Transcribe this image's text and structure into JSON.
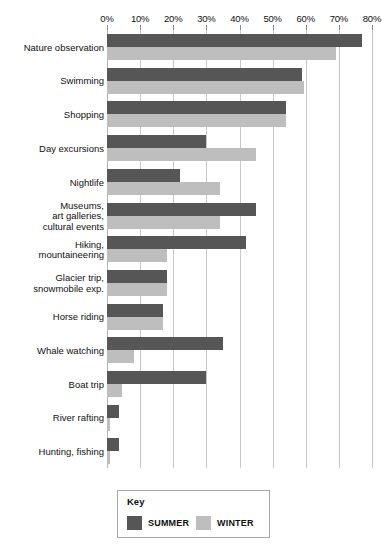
{
  "chart_data": {
    "type": "bar",
    "orientation": "horizontal",
    "title": "",
    "xlabel": "",
    "ylabel": "",
    "xlim": [
      0,
      80
    ],
    "grid": true,
    "legend_position": "bottom",
    "tick_labels": [
      "0%",
      "10%",
      "20%",
      "30%",
      "40%",
      "50%",
      "60%",
      "70%",
      "80%"
    ],
    "tick_values": [
      0,
      10,
      20,
      30,
      40,
      50,
      60,
      70,
      80
    ],
    "categories": [
      "Nature observation",
      "Swimming",
      "Shopping",
      "Day excursions",
      "Nightlife",
      "Museums,\nart galleries,\ncultural events",
      "Hiking,\nmountaineering",
      "Glacier trip,\nsnowmobile exp.",
      "Horse riding",
      "Whale watching",
      "Boat trip",
      "River rafting",
      "Hunting, fishing"
    ],
    "series": [
      {
        "name": "SUMMER",
        "color": "#565656",
        "values": [
          77,
          59,
          54,
          30,
          22,
          45,
          42,
          18,
          17,
          35,
          30,
          3.5,
          3.5
        ]
      },
      {
        "name": "WINTER",
        "color": "#bebebe",
        "values": [
          69,
          59.5,
          54,
          45,
          34,
          34,
          18,
          18,
          17,
          8,
          4.5,
          1,
          1
        ]
      }
    ]
  },
  "legend": {
    "title": "Key",
    "entries": [
      {
        "label": "SUMMER",
        "color": "#565656"
      },
      {
        "label": "WINTER",
        "color": "#bebebe"
      }
    ]
  }
}
